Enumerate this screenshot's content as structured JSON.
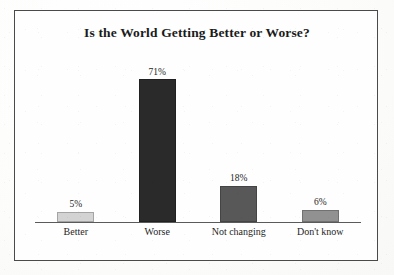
{
  "figure": {
    "background_color": "#fdfdfc",
    "frame_color": "#4a4a4a",
    "axis_color": "#5a5a5a"
  },
  "chart_data": {
    "type": "bar",
    "title": "Is the World Getting Better or Worse?",
    "xlabel": "",
    "ylabel": "",
    "ylim": [
      0,
      80
    ],
    "grid": false,
    "legend": "none",
    "categories": [
      "Better",
      "Worse",
      "Not changing",
      "Don't know"
    ],
    "values": [
      5,
      71,
      18,
      6
    ],
    "value_labels": [
      "5%",
      "71%",
      "18%",
      "6%"
    ],
    "bar_colors": [
      "#d3d3d3",
      "#2a2a2a",
      "#585858",
      "#919191"
    ],
    "bars": [
      {
        "category": "Better",
        "value": 5,
        "label": "5%",
        "color": "#d3d3d3"
      },
      {
        "category": "Worse",
        "value": 71,
        "label": "71%",
        "color": "#2a2a2a"
      },
      {
        "category": "Not changing",
        "value": 18,
        "label": "18%",
        "color": "#585858"
      },
      {
        "category": "Don't know",
        "value": 6,
        "label": "6%",
        "color": "#919191"
      }
    ]
  }
}
